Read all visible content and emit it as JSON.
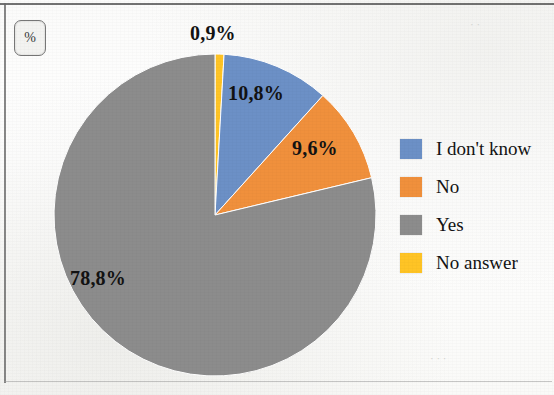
{
  "unit_badge": {
    "label": "%"
  },
  "chart_data": {
    "type": "pie",
    "title": "",
    "unit": "%",
    "categories": [
      "No answer",
      "I don't know",
      "No",
      "Yes"
    ],
    "values": [
      0.9,
      10.8,
      9.6,
      78.8
    ],
    "value_labels": [
      "0,9%",
      "10,8%",
      "9,6%",
      "78,8%"
    ],
    "colors": [
      "#FFC425",
      "#6C90C6",
      "#F0903C",
      "#8C8C8C"
    ],
    "start_angle_deg": 0,
    "direction": "clockwise",
    "legend_position": "right",
    "grid": false,
    "slices": [
      {
        "label": "No answer",
        "value": 0.9,
        "value_label": "0,9%",
        "color": "#FFC425"
      },
      {
        "label": "I don't know",
        "value": 10.8,
        "value_label": "10,8%",
        "color": "#6C90C6"
      },
      {
        "label": "No",
        "value": 9.6,
        "value_label": "9,6%",
        "color": "#F0903C"
      },
      {
        "label": "Yes",
        "value": 78.8,
        "value_label": "78,8%",
        "color": "#8C8C8C"
      }
    ]
  },
  "legend": {
    "items": [
      {
        "label": "I don't know",
        "color": "#6C90C6"
      },
      {
        "label": "No",
        "color": "#F0903C"
      },
      {
        "label": "Yes",
        "color": "#8C8C8C"
      },
      {
        "label": "No answer",
        "color": "#FFC425"
      }
    ]
  },
  "labels": {
    "no_answer": "0,9%",
    "dont_know": "10,8%",
    "no": "9,6%",
    "yes": "78,8%"
  }
}
